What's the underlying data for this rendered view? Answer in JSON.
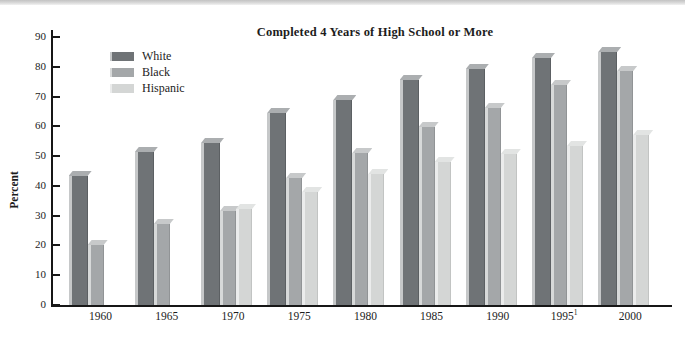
{
  "decor": {
    "top_band": true
  },
  "chart_data": {
    "type": "bar",
    "title": "Completed 4 Years of High School or More",
    "xlabel": "",
    "ylabel": "Percent",
    "ylim": [
      0,
      90
    ],
    "yticks": [
      0,
      10,
      20,
      30,
      40,
      50,
      60,
      70,
      80,
      90
    ],
    "grid": false,
    "legend_position": "upper-left-inside",
    "categories": [
      "1960",
      "1965",
      "1970",
      "1975",
      "1980",
      "1985",
      "1990",
      "1995",
      "2000"
    ],
    "xtick_superscripts": [
      "",
      "",
      "",
      "",
      "",
      "",
      "",
      "1",
      ""
    ],
    "series": [
      {
        "name": "White",
        "color": "#6f7376",
        "color_highlight": "#c6c8c9",
        "color_top": "#abaeb0",
        "color_right_edge": "#5c6063",
        "values": [
          43.2,
          51.3,
          54.5,
          64.5,
          68.8,
          75.5,
          79.1,
          83.0,
          84.9
        ]
      },
      {
        "name": "Black",
        "color": "#a4a7a9",
        "color_highlight": "#d7d9d9",
        "color_top": "#c7c9ca",
        "color_right_edge": "#919496",
        "values": [
          20.1,
          27.2,
          31.4,
          42.5,
          51.2,
          59.8,
          66.2,
          73.8,
          78.5
        ]
      },
      {
        "name": "Hispanic",
        "color": "#d4d6d5",
        "color_highlight": "#ebecec",
        "color_top": "#e2e4e3",
        "color_right_edge": "#c2c4c3",
        "values": [
          null,
          null,
          32.1,
          37.9,
          44.0,
          47.9,
          50.8,
          53.4,
          57.0
        ]
      }
    ]
  }
}
